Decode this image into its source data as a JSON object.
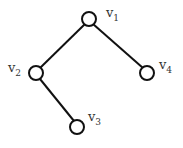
{
  "diagram": {
    "type": "tree",
    "stroke_color": "#111111",
    "nodes": [
      {
        "id": "v1",
        "label": "v",
        "subscript": "1",
        "cx": 89,
        "cy": 19
      },
      {
        "id": "v2",
        "label": "v",
        "subscript": "2",
        "cx": 36,
        "cy": 73
      },
      {
        "id": "v3",
        "label": "v",
        "subscript": "3",
        "cx": 77,
        "cy": 127
      },
      {
        "id": "v4",
        "label": "v",
        "subscript": "4",
        "cx": 147,
        "cy": 73
      }
    ],
    "edges": [
      {
        "from": "v1",
        "to": "v2"
      },
      {
        "from": "v1",
        "to": "v4"
      },
      {
        "from": "v2",
        "to": "v3"
      }
    ]
  }
}
